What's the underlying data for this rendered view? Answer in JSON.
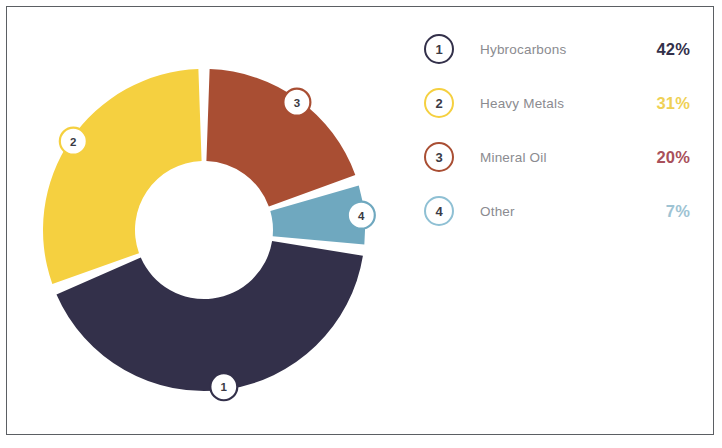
{
  "chart_data": {
    "type": "pie",
    "variant": "donut",
    "title": "",
    "subtitle": "",
    "xlabel": "",
    "ylabel": "",
    "grid": false,
    "legend_position": "right",
    "start_angle_deg": 0,
    "direction": "clockwise",
    "categories": [
      "Hybrocarbons",
      "Heavy Metals",
      "Mineral Oil",
      "Other"
    ],
    "values": [
      42,
      31,
      20,
      7
    ],
    "value_labels": [
      "42%",
      "31%",
      "20%",
      "7%"
    ],
    "units": "percent",
    "total": 100,
    "colors": [
      "#33304a",
      "#f5d040",
      "#a94e33",
      "#6fa8bf"
    ],
    "slice_markers": [
      "1",
      "2",
      "3",
      "4"
    ],
    "slices": [
      {
        "marker": "1",
        "label": "Hybrocarbons",
        "value": 42,
        "value_label": "42%",
        "color": "#33304a",
        "start_deg": 97.2,
        "end_deg": 248.4
      },
      {
        "marker": "2",
        "label": "Heavy Metals",
        "value": 31,
        "value_label": "31%",
        "color": "#f5d040",
        "start_deg": 248.4,
        "end_deg": 360.0
      },
      {
        "marker": "3",
        "label": "Mineral Oil",
        "value": 20,
        "value_label": "20%",
        "color": "#a94e33",
        "start_deg": 0.0,
        "end_deg": 72.0
      },
      {
        "marker": "4",
        "label": "Other",
        "value": 7,
        "value_label": "7%",
        "color": "#6fa8bf",
        "start_deg": 72.0,
        "end_deg": 97.2
      }
    ]
  },
  "legend": {
    "rows": [
      {
        "marker": "1",
        "label": "Hybrocarbons",
        "percent": "42%",
        "color": "#33304a",
        "percent_color": "#33304a"
      },
      {
        "marker": "2",
        "label": "Heavy Metals",
        "percent": "31%",
        "color": "#f5d040",
        "percent_color": "#efd155"
      },
      {
        "marker": "3",
        "label": "Mineral Oil",
        "percent": "20%",
        "color": "#a94e33",
        "percent_color": "#a9505a"
      },
      {
        "marker": "4",
        "label": "Other",
        "percent": "7%",
        "color": "#8fc0d4",
        "percent_color": "#9ec3d3"
      }
    ]
  }
}
